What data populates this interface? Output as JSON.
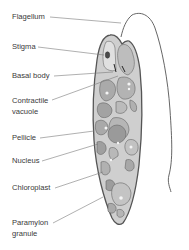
{
  "diagram": {
    "labels": [
      {
        "id": "flagellum",
        "text": "Flagellum",
        "x": 12,
        "y": 12
      },
      {
        "id": "stigma",
        "text": "Stigma",
        "x": 12,
        "y": 42
      },
      {
        "id": "basal-body",
        "text": "Basal body",
        "x": 12,
        "y": 71
      },
      {
        "id": "contractile-vacuole",
        "text": "Contractile",
        "text2": "vacuole",
        "x": 12,
        "y": 96
      },
      {
        "id": "pellicle",
        "text": "Pellicle",
        "x": 12,
        "y": 133
      },
      {
        "id": "nucleus",
        "text": "Nucleus",
        "x": 12,
        "y": 156
      },
      {
        "id": "chloroplast",
        "text": "Chloroplast",
        "x": 12,
        "y": 183
      },
      {
        "id": "paramylon-granule",
        "text": "Paramylon",
        "text2": "granule",
        "x": 12,
        "y": 218
      }
    ],
    "colors": {
      "outline": "#555555",
      "leader_line": "#7a7a7a",
      "cell_fill": "#cfcfcf",
      "organelle_fill": "#a9a9a9",
      "organelle_light": "#e2e2e2",
      "stigma": "#4a4a4a"
    }
  }
}
